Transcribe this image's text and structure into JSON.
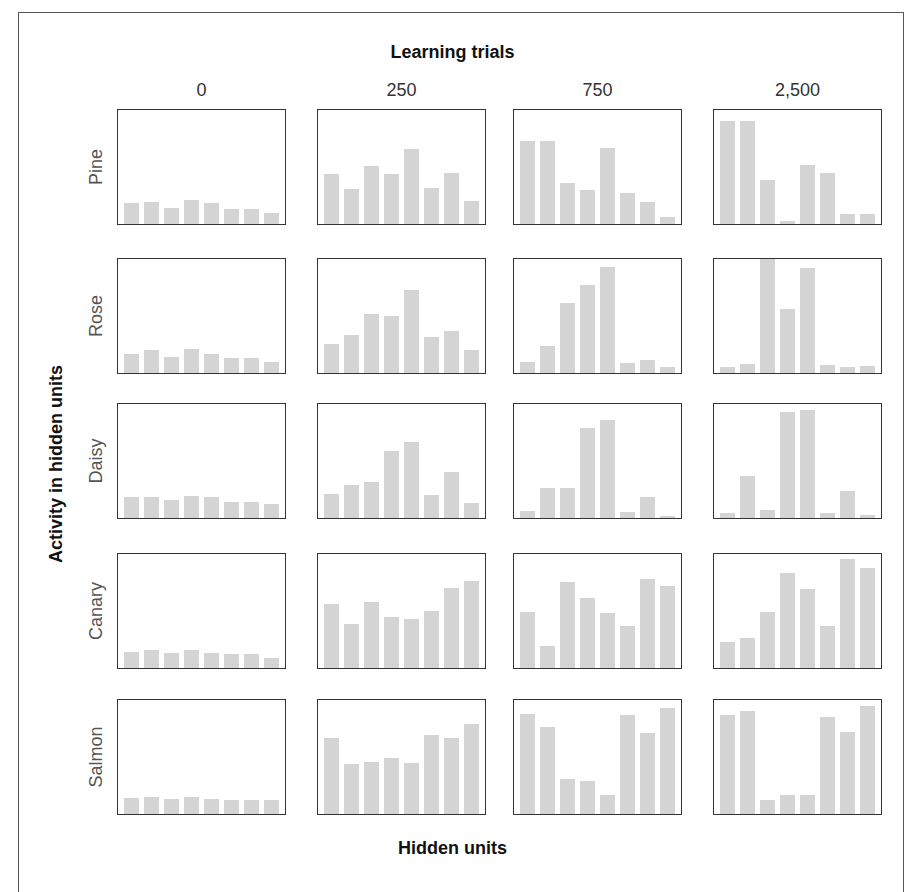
{
  "figure": {
    "top_title": "Learning trials",
    "y_title": "Activity in hidden units",
    "x_title": "Hidden units"
  },
  "chart_data": {
    "type": "bar",
    "title": "Learning trials",
    "xlabel": "Hidden units",
    "ylabel": "Activity in hidden units",
    "columns": [
      "0",
      "250",
      "750",
      "2,500"
    ],
    "rows": [
      "Pine",
      "Rose",
      "Daisy",
      "Canary",
      "Salmon"
    ],
    "hidden_units": [
      1,
      2,
      3,
      4,
      5,
      6,
      7,
      8
    ],
    "ylim": [
      0,
      1
    ],
    "grid": false,
    "panels": {
      "Pine": {
        "0": [
          0.18,
          0.19,
          0.14,
          0.21,
          0.18,
          0.13,
          0.13,
          0.1
        ],
        "250": [
          0.44,
          0.31,
          0.51,
          0.44,
          0.66,
          0.32,
          0.45,
          0.2
        ],
        "750": [
          0.73,
          0.73,
          0.36,
          0.3,
          0.67,
          0.27,
          0.19,
          0.06
        ],
        "2,500": [
          0.9,
          0.9,
          0.39,
          0.03,
          0.52,
          0.45,
          0.09,
          0.09
        ]
      },
      "Rose": {
        "0": [
          0.17,
          0.2,
          0.14,
          0.21,
          0.17,
          0.13,
          0.13,
          0.1
        ],
        "250": [
          0.25,
          0.33,
          0.52,
          0.5,
          0.73,
          0.32,
          0.37,
          0.2
        ],
        "750": [
          0.1,
          0.24,
          0.61,
          0.77,
          0.93,
          0.09,
          0.11,
          0.05
        ],
        "2,500": [
          0.05,
          0.08,
          1.0,
          0.56,
          0.92,
          0.07,
          0.05,
          0.06
        ]
      },
      "Daisy": {
        "0": [
          0.18,
          0.18,
          0.16,
          0.19,
          0.18,
          0.14,
          0.14,
          0.12
        ],
        "250": [
          0.21,
          0.29,
          0.32,
          0.59,
          0.67,
          0.2,
          0.4,
          0.13
        ],
        "750": [
          0.06,
          0.26,
          0.26,
          0.79,
          0.86,
          0.05,
          0.18,
          0.02
        ],
        "2,500": [
          0.04,
          0.37,
          0.07,
          0.93,
          0.95,
          0.04,
          0.24,
          0.03
        ]
      },
      "Canary": {
        "0": [
          0.14,
          0.16,
          0.13,
          0.16,
          0.13,
          0.12,
          0.12,
          0.09
        ],
        "250": [
          0.56,
          0.39,
          0.58,
          0.45,
          0.43,
          0.5,
          0.7,
          0.76
        ],
        "750": [
          0.49,
          0.19,
          0.75,
          0.61,
          0.48,
          0.37,
          0.78,
          0.72
        ],
        "2,500": [
          0.23,
          0.26,
          0.49,
          0.83,
          0.69,
          0.37,
          0.96,
          0.88
        ]
      },
      "Salmon": {
        "0": [
          0.14,
          0.15,
          0.13,
          0.15,
          0.13,
          0.12,
          0.12,
          0.12
        ],
        "250": [
          0.67,
          0.44,
          0.46,
          0.49,
          0.45,
          0.69,
          0.67,
          0.79
        ],
        "750": [
          0.88,
          0.76,
          0.31,
          0.29,
          0.17,
          0.87,
          0.71,
          0.93
        ],
        "2,500": [
          0.87,
          0.9,
          0.12,
          0.17,
          0.17,
          0.85,
          0.72,
          0.95
        ]
      }
    }
  },
  "colors": {
    "bar": "#d4d4d4",
    "panel_border": "#333333",
    "frame": "#555555"
  }
}
